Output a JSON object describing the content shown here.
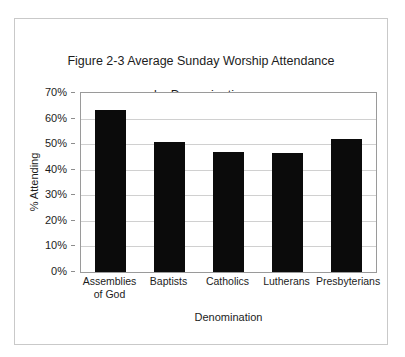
{
  "chart_data": {
    "type": "bar",
    "title": "Figure 2-3 Average Sunday Worship Attendance\nby Denomination",
    "title_line1": "Figure 2-3 Average Sunday Worship Attendance",
    "title_line2": "by Denomination",
    "xlabel": "Denomination",
    "ylabel": "% Attending",
    "categories": [
      "Assemblies\nof God",
      "Baptists",
      "Catholics",
      "Lutherans",
      "Presbyterians"
    ],
    "categories_flat": [
      "Assemblies of God",
      "Baptists",
      "Catholics",
      "Lutherans",
      "Presbyterians"
    ],
    "values": [
      63.5,
      51,
      47,
      46.5,
      52
    ],
    "ylim": [
      0,
      70
    ],
    "ytick_values": [
      70,
      60,
      50,
      40,
      30,
      20,
      10,
      0
    ],
    "ytick_labels": [
      "70%",
      "60%",
      "50%",
      "40%",
      "30%",
      "20%",
      "10%",
      "0%"
    ],
    "grid": true,
    "legend": false,
    "legend_position": "none",
    "bar_color": "#0b0b0b",
    "gridline_color": "#d0d0d0",
    "axis_color": "#9a9a9a",
    "background_color": "#ffffff",
    "border_color": "#c9c9c9"
  }
}
